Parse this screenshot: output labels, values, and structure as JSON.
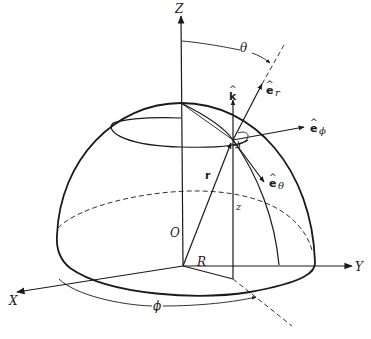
{
  "diagram": {
    "axes": {
      "z_label": "Z",
      "y_label": "Y",
      "x_label": "X",
      "origin_label": "O"
    },
    "angles": {
      "theta_label": "θ",
      "phi_label": "ϕ"
    },
    "vectors": {
      "position_label": "r",
      "k_label": "k",
      "k_hat": "^",
      "er_label": "e",
      "er_sub": "r",
      "er_hat": "^",
      "ephi_label": "e",
      "ephi_sub": "ϕ",
      "ephi_hat": "^",
      "etheta_label": "e",
      "etheta_sub": "θ",
      "etheta_hat": "^"
    },
    "lengths": {
      "height_label": "z",
      "radial_label": "R"
    },
    "colors": {
      "ink": "#1a1a1a",
      "background": "#ffffff"
    }
  }
}
